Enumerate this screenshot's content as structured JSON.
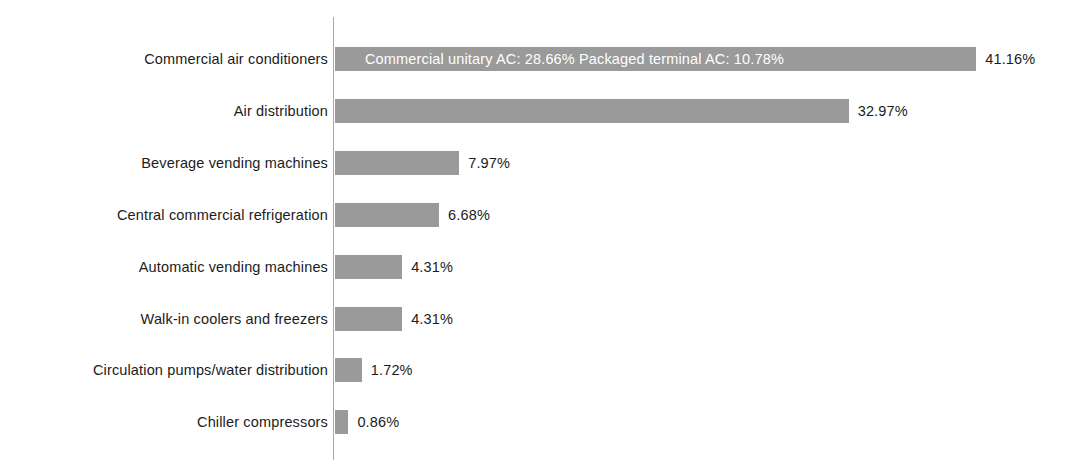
{
  "chart_data": {
    "type": "bar",
    "orientation": "horizontal",
    "title": "",
    "subtitle": "",
    "xlabel": "",
    "ylabel": "",
    "grid": false,
    "legend": "none",
    "axis_line": "category axis at left of bars",
    "value_suffix": "%",
    "xlim": [
      0,
      41.16
    ],
    "categories": [
      "Commercial air conditioners",
      "Air distribution",
      "Beverage vending machines",
      "Central commercial refrigeration",
      "Automatic vending machines",
      "Walk-in coolers and freezers",
      "Circulation pumps/water distribution",
      "Chiller compressors"
    ],
    "values": [
      41.16,
      32.97,
      7.97,
      6.68,
      4.31,
      4.31,
      1.72,
      0.86
    ],
    "value_labels": [
      "41.16%",
      "32.97%",
      "7.97%",
      "6.68%",
      "4.31%",
      "4.31%",
      "1.72%",
      "0.86%"
    ],
    "annotations": [
      {
        "category": "Commercial air conditioners",
        "inside_bar_text": "Commercial unitary AC: 28.66%  Packaged terminal AC: 10.78%",
        "components": [
          {
            "name": "Commercial unitary AC",
            "value": 28.66,
            "label": "Commercial unitary AC: 28.66%"
          },
          {
            "name": "Packaged terminal AC",
            "value": 10.78,
            "label": "Packaged terminal AC: 10.78%"
          }
        ]
      }
    ]
  },
  "style": {
    "bar_color": "#9a9a9a",
    "axis_color": "#a8a8a8",
    "text_color": "#1c1c1c",
    "inside_text_color": "#ffffff",
    "background": "#ffffff"
  },
  "rows": [
    {
      "label": "Commercial air conditioners",
      "value": 41.16,
      "value_label": "41.16%",
      "inside_text": "Commercial unitary AC: 28.66%  Packaged terminal AC: 10.78%"
    },
    {
      "label": "Air distribution",
      "value": 32.97,
      "value_label": "32.97%",
      "inside_text": ""
    },
    {
      "label": "Beverage vending machines",
      "value": 7.97,
      "value_label": "7.97%",
      "inside_text": ""
    },
    {
      "label": "Central commercial refrigeration",
      "value": 6.68,
      "value_label": "6.68%",
      "inside_text": ""
    },
    {
      "label": "Automatic vending machines",
      "value": 4.31,
      "value_label": "4.31%",
      "inside_text": ""
    },
    {
      "label": "Walk-in coolers and freezers",
      "value": 4.31,
      "value_label": "4.31%",
      "inside_text": ""
    },
    {
      "label": "Circulation pumps/water distribution",
      "value": 1.72,
      "value_label": "1.72%",
      "inside_text": ""
    },
    {
      "label": "Chiller compressors",
      "value": 0.86,
      "value_label": "0.86%",
      "inside_text": ""
    }
  ]
}
